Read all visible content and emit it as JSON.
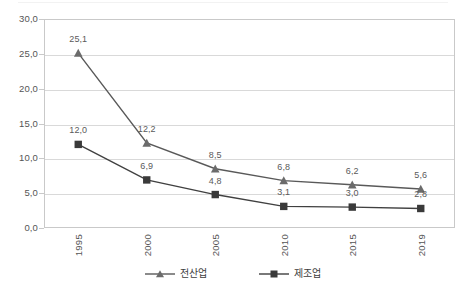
{
  "chart_data": {
    "type": "line",
    "title": "",
    "subtitle": "",
    "xlabel": "",
    "ylabel": "",
    "categories": [
      "1995",
      "2000",
      "2005",
      "2010",
      "2015",
      "2019"
    ],
    "ylim": [
      0.0,
      30.0
    ],
    "yticks": [
      0.0,
      5.0,
      10.0,
      15.0,
      20.0,
      25.0,
      30.0
    ],
    "ytick_labels": [
      "0,0",
      "5,0",
      "10,0",
      "15,0",
      "20,0",
      "25,0",
      "30,0"
    ],
    "grid": true,
    "legend_position": "bottom-center",
    "decimal_separator": ",",
    "series": [
      {
        "name": "전산업",
        "marker": "triangle",
        "color": "#595959",
        "values": [
          25.1,
          12.2,
          8.5,
          6.8,
          6.2,
          5.6
        ],
        "data_labels": [
          "25,1",
          "12,2",
          "8,5",
          "6,8",
          "6,2",
          "5,6"
        ]
      },
      {
        "name": "제조업",
        "marker": "square",
        "color": "#404040",
        "values": [
          12.0,
          6.9,
          4.8,
          3.1,
          3.0,
          2.8
        ],
        "data_labels": [
          "12,0",
          "6,9",
          "4,8",
          "3,1",
          "3,0",
          "2,8"
        ]
      }
    ]
  },
  "legend": {
    "items": [
      {
        "label": "전산업",
        "marker": "triangle-marker-icon"
      },
      {
        "label": "제조업",
        "marker": "square-marker-icon"
      }
    ]
  },
  "colors": {
    "series_all_industry": "#595959",
    "series_manufacturing": "#404040",
    "gridline": "#d9d9d9",
    "plot_border": "#c9c9c9",
    "axis_text": "#555555",
    "data_label_text": "#5a5a5a",
    "background": "#ffffff"
  }
}
